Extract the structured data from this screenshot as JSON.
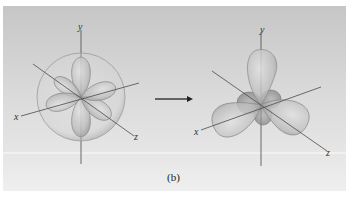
{
  "figure": {
    "caption": "(b)",
    "arrow": "transforms-to",
    "left_panel": {
      "name": "atomic-orbitals",
      "axes": {
        "x": "x",
        "y": "y",
        "z": "z"
      },
      "contents": [
        "s-orbital-sphere",
        "px-orbital",
        "py-orbital",
        "pz-orbital"
      ]
    },
    "right_panel": {
      "name": "sp3-hybrid-orbitals",
      "axes": {
        "x": "x",
        "y": "y",
        "z": "z"
      },
      "lobe_count": 4
    },
    "colors": {
      "background_top": "#c9c9c9",
      "background_bottom": "#ececec",
      "lobe_fill": "#c4c4c4",
      "lobe_stroke": "#8a8a8a",
      "axis": "#4a4a4a"
    }
  }
}
